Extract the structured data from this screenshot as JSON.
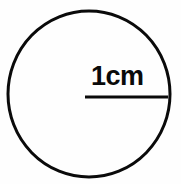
{
  "figure": {
    "background_color": "#fefefe",
    "stroke_color": "#0a0a0a",
    "labels": {
      "radius_label": "1cm"
    },
    "geometry": {
      "circle": {
        "center_x": 89,
        "center_y": 94,
        "radius": 82,
        "stroke_width": 3
      },
      "radius_line": {
        "x1": 85,
        "y1": 97,
        "x2": 168,
        "y2": 97,
        "stroke_width": 3
      },
      "label_position": {
        "x": 91,
        "y": 85
      }
    }
  }
}
